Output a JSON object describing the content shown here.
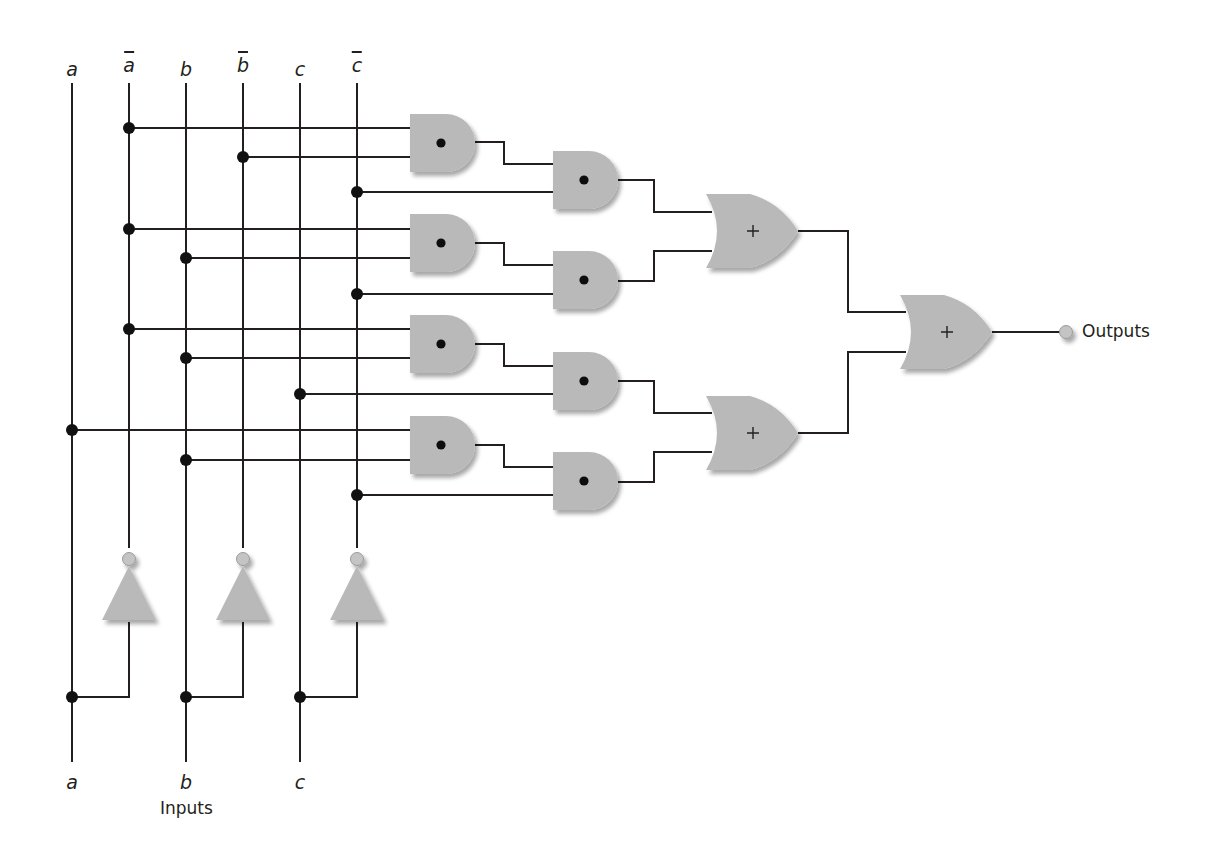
{
  "diagram": {
    "type": "logic-circuit",
    "colors": {
      "wire": "#231f20",
      "gate_fill": "#b9b9b9",
      "gate_shadow": "#d6d6d6",
      "junction": "#111111",
      "output_terminal": "#c4c4c4"
    },
    "top_labels": [
      {
        "id": "a",
        "text": "a",
        "negated": false
      },
      {
        "id": "a_not",
        "text": "a",
        "negated": true
      },
      {
        "id": "b",
        "text": "b",
        "negated": false
      },
      {
        "id": "b_not",
        "text": "b",
        "negated": true
      },
      {
        "id": "c",
        "text": "c",
        "negated": false
      },
      {
        "id": "c_not",
        "text": "c",
        "negated": true
      }
    ],
    "bottom_labels": [
      {
        "id": "a",
        "text": "a"
      },
      {
        "id": "b",
        "text": "b"
      },
      {
        "id": "c",
        "text": "c"
      }
    ],
    "inputs_caption": "Inputs",
    "output_caption": "Outputs",
    "and_gate_symbol": "•",
    "or_gate_symbol": "+",
    "gates": {
      "not": [
        {
          "id": "not_a",
          "input": "a",
          "output": "a_not"
        },
        {
          "id": "not_b",
          "input": "b",
          "output": "b_not"
        },
        {
          "id": "not_c",
          "input": "c",
          "output": "c_not"
        }
      ],
      "and_first_level": [
        {
          "id": "and1",
          "inputs": [
            "a_not",
            "b_not"
          ]
        },
        {
          "id": "and3",
          "inputs": [
            "a_not",
            "b"
          ]
        },
        {
          "id": "and5",
          "inputs": [
            "a_not",
            "b"
          ]
        },
        {
          "id": "and7",
          "inputs": [
            "a",
            "b"
          ]
        }
      ],
      "and_second_level": [
        {
          "id": "and2",
          "inputs": [
            "and1",
            "c_not"
          ]
        },
        {
          "id": "and4",
          "inputs": [
            "and3",
            "c_not"
          ]
        },
        {
          "id": "and6",
          "inputs": [
            "and5",
            "c"
          ]
        },
        {
          "id": "and8",
          "inputs": [
            "and7",
            "c_not"
          ]
        }
      ],
      "or": [
        {
          "id": "or1",
          "inputs": [
            "and2",
            "and4"
          ]
        },
        {
          "id": "or2",
          "inputs": [
            "and6",
            "and8"
          ]
        },
        {
          "id": "or3",
          "inputs": [
            "or1",
            "or2"
          ],
          "output": "Outputs"
        }
      ]
    }
  }
}
